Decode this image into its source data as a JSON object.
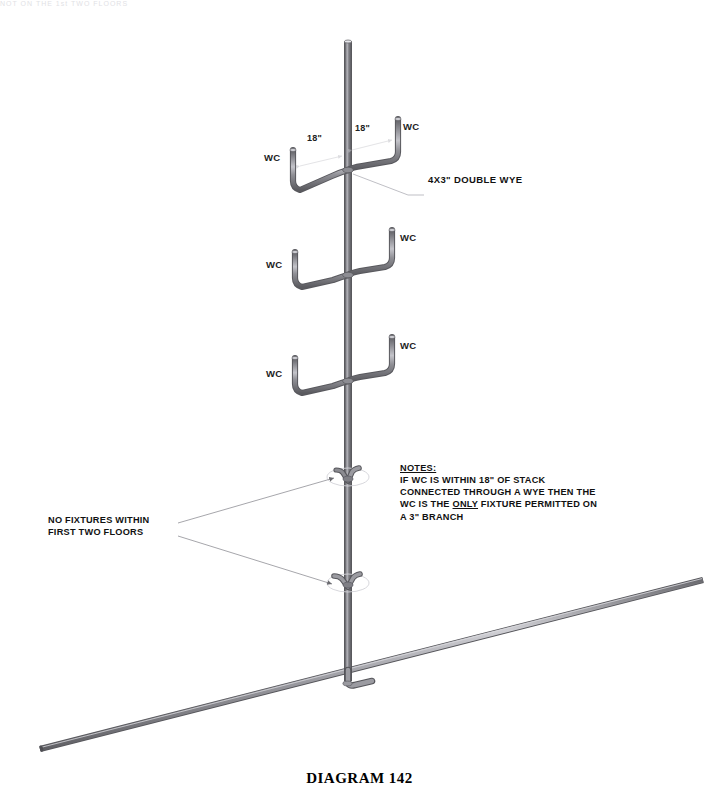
{
  "caption": "DIAGRAM 142",
  "page_header_fragment": "NOT ON THE 1st TWO FLOORS",
  "callouts": {
    "double_wye": "4X3\" DOUBLE WYE",
    "no_fixtures": [
      "NO FIXTURES WITHIN",
      "FIRST TWO FLOORS"
    ]
  },
  "notes": {
    "title": "NOTES:",
    "lines": [
      "IF WC IS WITHIN 18\" OF STACK",
      "CONNECTED THROUGH A WYE THEN THE",
      "WC IS THE ONLY FIXTURE PERMITTED ON",
      "A 3\" BRANCH"
    ],
    "line3_pre": "WC IS THE ",
    "line3_emph": "ONLY",
    "line3_post": " FIXTURE PERMITTED ON"
  },
  "dimensions": {
    "left": "18\"",
    "right": "18\""
  },
  "fixtures": {
    "label": "WC",
    "branches": [
      {
        "level": 1,
        "left_label": "WC",
        "right_label": "WC",
        "dimensioned": true
      },
      {
        "level": 2,
        "left_label": "WC",
        "right_label": "WC",
        "dimensioned": false
      },
      {
        "level": 3,
        "left_label": "WC",
        "right_label": "WC",
        "dimensioned": false
      }
    ]
  },
  "components": {
    "stack": "vertical-soil-stack",
    "building_drain": "sloped-building-drain",
    "capped_wye_upper": "capped-wye-no-fixture",
    "capped_wye_lower": "capped-double-wye-no-fixture"
  },
  "colors": {
    "pipe_dark": "#6e6e73",
    "pipe_mid": "#8e8e94",
    "pipe_light": "#c9c9cf",
    "pipe_edge": "#5a5a5f",
    "leader": "#9a9a9f",
    "text": "#111111",
    "background": "#ffffff"
  }
}
